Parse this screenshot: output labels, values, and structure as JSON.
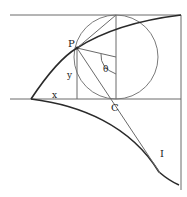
{
  "diagram": {
    "type": "geometric-construction",
    "labels": {
      "point_p": "P",
      "point_c": "C",
      "point_i": "I",
      "x_label": "x",
      "y_label": "y",
      "angle_label": "θ"
    },
    "colors": {
      "thick_curve": "#2a2a2a",
      "thin_line": "#6a6a6a",
      "circle": "#7a7a7a",
      "background": "#ffffff"
    }
  }
}
